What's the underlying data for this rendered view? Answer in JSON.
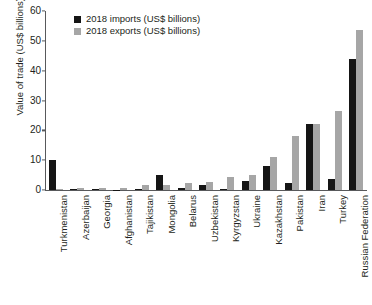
{
  "chart_data": {
    "type": "bar",
    "title": "",
    "xlabel": "",
    "ylabel": "Value of trade (US$ billions)",
    "ylim": [
      0,
      60
    ],
    "yticks": [
      0,
      10,
      20,
      30,
      40,
      50,
      60
    ],
    "grid": false,
    "legend_position": "top-left",
    "categories": [
      "Turkmenistan",
      "Azerbaijan",
      "Georgia",
      "Afghanistan",
      "Tajikistan",
      "Mongolia",
      "Belarus",
      "Uzbekistan",
      "Kyrgyzstan",
      "Ukraine",
      "Kazakhstan",
      "Pakistan",
      "Iran",
      "Turkey",
      "Russian Federation"
    ],
    "series": [
      {
        "name": "2018 imports (US$ billions)",
        "color": "#151515",
        "values": [
          10.0,
          0.4,
          0.3,
          0.1,
          0.2,
          5.2,
          0.6,
          1.7,
          0.3,
          3.0,
          8.2,
          2.4,
          22.0,
          3.6,
          44.0
        ]
      },
      {
        "name": "2018 exports (US$ billions)",
        "color": "#a6a6a6",
        "values": [
          0.4,
          0.6,
          0.6,
          0.8,
          1.6,
          1.7,
          2.4,
          2.6,
          4.5,
          5.0,
          11.0,
          18.0,
          22.0,
          26.5,
          53.5
        ]
      }
    ]
  },
  "axis": {
    "y_title": "Value of trade (US$ billions)"
  },
  "legend": {
    "items": [
      {
        "label": "2018 imports (US$ billions)",
        "color": "#151515"
      },
      {
        "label": "2018 exports (US$ billions)",
        "color": "#a6a6a6"
      }
    ]
  }
}
